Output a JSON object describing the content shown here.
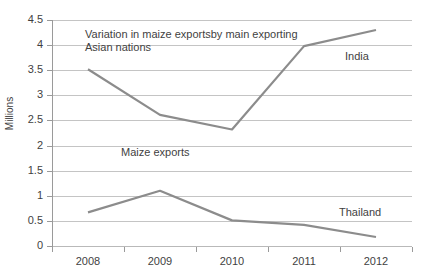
{
  "chart_data": {
    "type": "line",
    "title": "Variation in maize exportsby main exporting Asian nations",
    "xlabel": "",
    "ylabel": "Millions",
    "x": [
      "2008",
      "2009",
      "2010",
      "2011",
      "2012"
    ],
    "categories": [
      "2008",
      "2009",
      "2010",
      "2011",
      "2012"
    ],
    "series": [
      {
        "name": "India",
        "values": [
          3.52,
          2.61,
          2.32,
          3.98,
          4.3
        ]
      },
      {
        "name": "Thailand",
        "values": [
          0.67,
          1.1,
          0.51,
          0.42,
          0.18
        ]
      }
    ],
    "ylim": [
      0,
      4.5
    ],
    "yticks": [
      "0",
      "0.5",
      "1",
      "1.5",
      "2",
      "2.5",
      "3",
      "3.5",
      "4",
      "4.5"
    ],
    "ytick_values": [
      0,
      0.5,
      1,
      1.5,
      2,
      2.5,
      3,
      3.5,
      4,
      4.5
    ],
    "grid": true,
    "legend": "none",
    "series_color": "#8c8c8c",
    "grid_color": "#c4c4c4",
    "axis_color": "#9a9a9a",
    "text_color": "#3f3f3f",
    "annotations": [
      {
        "text": "Variation in maize exportsby main exporting Asian nations",
        "role": "title"
      },
      {
        "text": "Maize exports",
        "role": "inline-label"
      },
      {
        "text": "India",
        "role": "series-label"
      },
      {
        "text": "Thailand",
        "role": "series-label"
      }
    ]
  },
  "labels": {
    "y_axis_title": "Millions",
    "title": "Variation in maize exportsby main exporting Asian nations",
    "maize_exports": "Maize exports",
    "india": "India",
    "thailand": "Thailand"
  }
}
